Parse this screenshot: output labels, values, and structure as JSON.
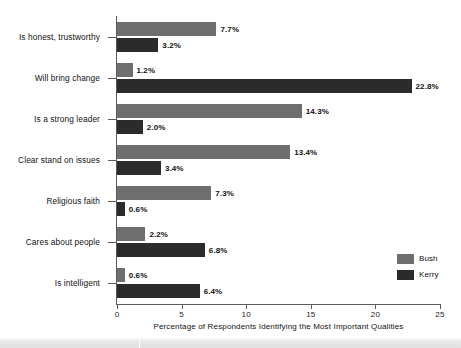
{
  "chart_data": {
    "type": "bar",
    "orientation": "horizontal",
    "title": "",
    "subtitle": "",
    "xlabel": "Percentage of Respondents Identifying the Most Important Qualities",
    "ylabel": "",
    "xlim": [
      0,
      25
    ],
    "xticks": [
      0,
      5,
      10,
      15,
      20,
      25
    ],
    "xtick_labels": [
      "0",
      "5",
      "10",
      "15",
      "20",
      "25"
    ],
    "grid": false,
    "legend_position": "right-lower",
    "categories": [
      "Is honest, trustworthy",
      "Will bring change",
      "Is a strong leader",
      "Clear stand on issues",
      "Religious faith",
      "Cares about people",
      "Is intelligent"
    ],
    "series": [
      {
        "name": "Bush",
        "color": "#6e6e6e",
        "values": [
          7.7,
          1.2,
          14.3,
          13.4,
          7.3,
          2.2,
          0.6
        ],
        "labels": [
          "7.7%",
          "1.2%",
          "14.3%",
          "13.4%",
          "7.3%",
          "2.2%",
          "0.6%"
        ]
      },
      {
        "name": "Kerry",
        "color": "#2b2b2b",
        "values": [
          3.2,
          22.8,
          2.0,
          3.4,
          0.6,
          6.8,
          6.4
        ],
        "labels": [
          "3.2%",
          "22.8%",
          "2.0%",
          "3.4%",
          "0.6%",
          "6.8%",
          "6.4%"
        ]
      }
    ]
  },
  "legend": {
    "items": [
      {
        "label": "Bush",
        "color": "#6e6e6e"
      },
      {
        "label": "Kerry",
        "color": "#2b2b2b"
      }
    ]
  }
}
